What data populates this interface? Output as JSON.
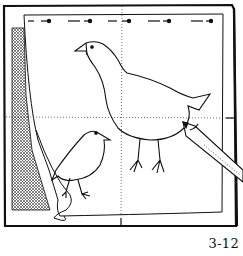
{
  "figure": {
    "caption": "3-12",
    "colors": {
      "ink": "#111111",
      "paper": "#ffffff",
      "hatch": "#555555"
    }
  }
}
